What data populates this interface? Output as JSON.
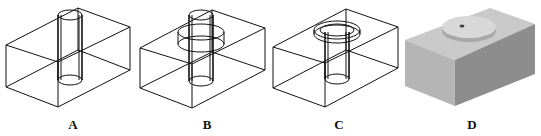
{
  "figure": {
    "panels": [
      {
        "id": "A",
        "label": "A",
        "style": "wireframe",
        "feature": "through-hole"
      },
      {
        "id": "B",
        "label": "B",
        "style": "wireframe",
        "feature": "through-hole with internal counterbore ring"
      },
      {
        "id": "C",
        "label": "C",
        "style": "wireframe",
        "feature": "through-hole with top counterbore"
      },
      {
        "id": "D",
        "label": "D",
        "style": "shaded",
        "feature": "solid block with raised disc and small hole"
      }
    ],
    "colors": {
      "line": "#111111",
      "shade_top": "#c8c8c8",
      "shade_left": "#b4b4b4",
      "shade_right": "#8c8c8c",
      "disc": "#d6d6d6"
    }
  }
}
